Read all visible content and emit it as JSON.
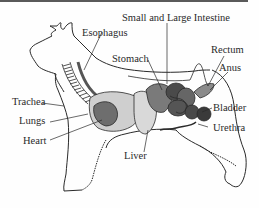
{
  "diagram": {
    "labels": {
      "intestine": "Small and Large Intestine",
      "esophagus": "Esophagus",
      "stomach": "Stomach",
      "rectum": "Rectum",
      "anus": "Anus",
      "trachea": "Trachea",
      "lungs": "Lungs",
      "heart": "Heart",
      "liver": "Liver",
      "bladder": "Bladder",
      "urethra": "Urethra"
    },
    "colors": {
      "outline": "#2a2a2a",
      "lungs_fill": "#cfcfcf",
      "heart_fill": "#6e6e6e",
      "liver_fill": "#d9d9d9",
      "stomach_fill": "#7a7a7a",
      "intestine_fill": "#4a4a4a",
      "bladder_fill": "#3a3a3a",
      "esophagus_fill": "#555555",
      "rectum_fill": "#8a8a8a"
    }
  }
}
